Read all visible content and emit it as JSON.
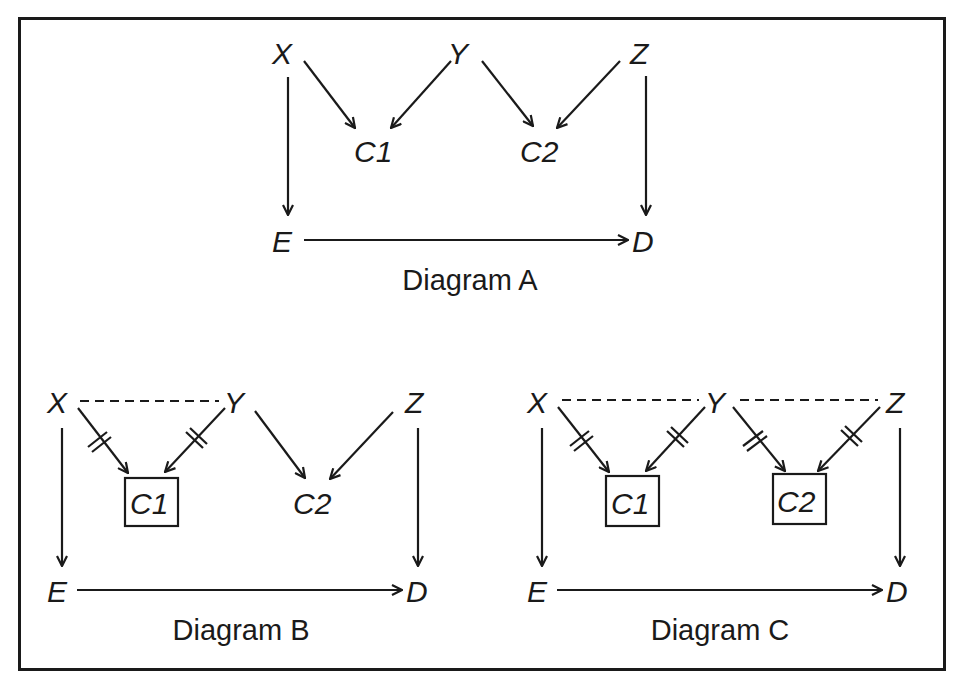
{
  "figure": {
    "diagrams": [
      {
        "id": "A",
        "caption": "Diagram A",
        "nodes": {
          "X": "X",
          "Y": "Y",
          "Z": "Z",
          "C1": "C1",
          "C2": "C2",
          "E": "E",
          "D": "D"
        },
        "edges": [
          {
            "from": "X",
            "to": "C1",
            "type": "directed"
          },
          {
            "from": "Y",
            "to": "C1",
            "type": "directed"
          },
          {
            "from": "Y",
            "to": "C2",
            "type": "directed"
          },
          {
            "from": "Z",
            "to": "C2",
            "type": "directed"
          },
          {
            "from": "X",
            "to": "E",
            "type": "directed"
          },
          {
            "from": "Z",
            "to": "D",
            "type": "directed"
          },
          {
            "from": "E",
            "to": "D",
            "type": "directed"
          }
        ],
        "boxed_nodes": []
      },
      {
        "id": "B",
        "caption": "Diagram B",
        "nodes": {
          "X": "X",
          "Y": "Y",
          "Z": "Z",
          "C1": "C1",
          "C2": "C2",
          "E": "E",
          "D": "D"
        },
        "edges": [
          {
            "from": "X",
            "to": "C1",
            "type": "directed-blocked"
          },
          {
            "from": "Y",
            "to": "C1",
            "type": "directed-blocked"
          },
          {
            "from": "Y",
            "to": "C2",
            "type": "directed"
          },
          {
            "from": "Z",
            "to": "C2",
            "type": "directed"
          },
          {
            "from": "X",
            "to": "E",
            "type": "directed"
          },
          {
            "from": "Z",
            "to": "D",
            "type": "directed"
          },
          {
            "from": "E",
            "to": "D",
            "type": "directed"
          },
          {
            "from": "X",
            "to": "Y",
            "type": "dashed"
          }
        ],
        "boxed_nodes": [
          "C1"
        ]
      },
      {
        "id": "C",
        "caption": "Diagram C",
        "nodes": {
          "X": "X",
          "Y": "Y",
          "Z": "Z",
          "C1": "C1",
          "C2": "C2",
          "E": "E",
          "D": "D"
        },
        "edges": [
          {
            "from": "X",
            "to": "C1",
            "type": "directed-blocked"
          },
          {
            "from": "Y",
            "to": "C1",
            "type": "directed-blocked"
          },
          {
            "from": "Y",
            "to": "C2",
            "type": "directed-blocked"
          },
          {
            "from": "Z",
            "to": "C2",
            "type": "directed-blocked"
          },
          {
            "from": "X",
            "to": "E",
            "type": "directed"
          },
          {
            "from": "Z",
            "to": "D",
            "type": "directed"
          },
          {
            "from": "E",
            "to": "D",
            "type": "directed"
          },
          {
            "from": "X",
            "to": "Y",
            "type": "dashed"
          },
          {
            "from": "Y",
            "to": "Z",
            "type": "dashed"
          }
        ],
        "boxed_nodes": [
          "C1",
          "C2"
        ]
      }
    ]
  }
}
